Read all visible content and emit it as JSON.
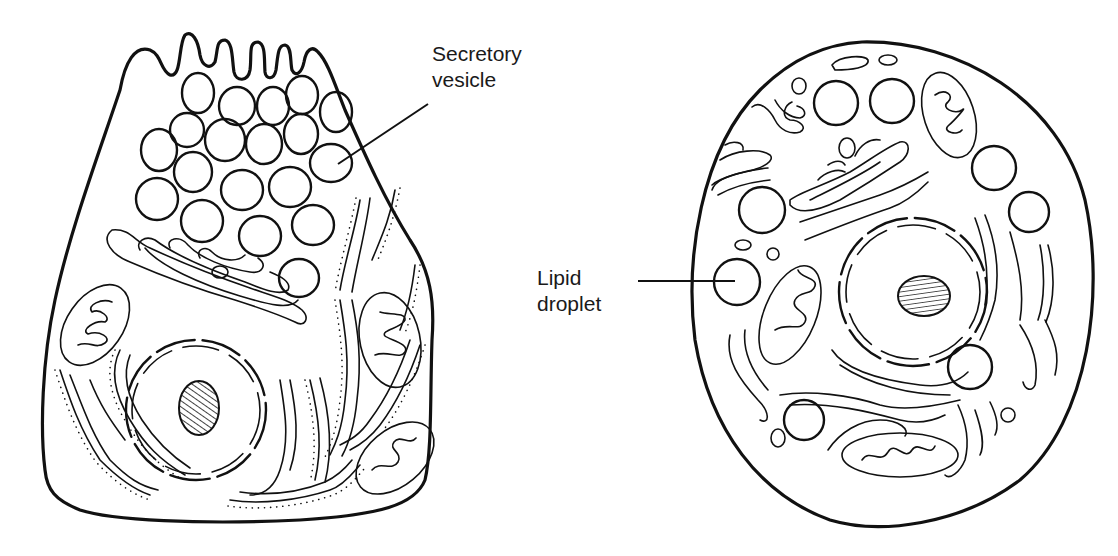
{
  "figure": {
    "left_cell": {
      "name": "protein-secreting cell",
      "label": {
        "line1": "Secretory",
        "line2": "vesicle"
      }
    },
    "right_cell": {
      "name": "lipid-secreting cell",
      "label": {
        "line1": "Lipid",
        "line2": "droplet"
      }
    }
  },
  "colors": {
    "ink": "#111111",
    "background": "#ffffff"
  }
}
